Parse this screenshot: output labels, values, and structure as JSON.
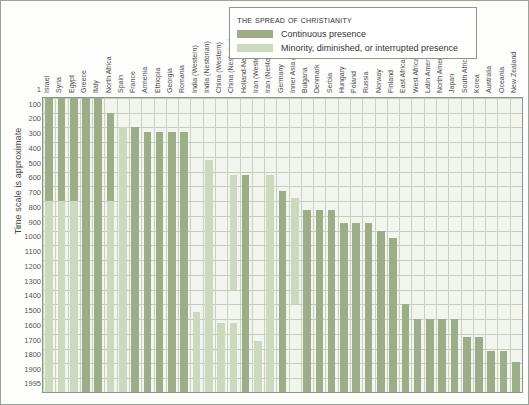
{
  "axis": {
    "y_title": "Time scale is approximate",
    "y_ticks": [
      "1",
      "100",
      "200",
      "300",
      "400",
      "500",
      "600",
      "700",
      "800",
      "900",
      "1000",
      "1100",
      "1200",
      "1300",
      "1400",
      "1500",
      "1600",
      "1700",
      "1800",
      "1900",
      "1995"
    ]
  },
  "legend": {
    "title": "The spread of Christianity",
    "entries": [
      {
        "key": "continuous",
        "label": "Continuous presence",
        "color": "#9cad88"
      },
      {
        "key": "minority",
        "label": "Minority, diminished, or interrupted presence",
        "color": "#cdd9bf"
      }
    ]
  },
  "chart_data": {
    "type": "bar",
    "title": "The spread of Christianity",
    "xlabel": "",
    "ylabel": "Time scale is approximate",
    "ylim": [
      1,
      1995
    ],
    "y_inverted": true,
    "grid": true,
    "legend_position": "top-right",
    "series": [
      {
        "name": "Continuous presence",
        "color": "#9cad88"
      },
      {
        "name": "Minority, diminished, or interrupted presence",
        "color": "#cdd9bf"
      }
    ],
    "categories": [
      "Israel",
      "Syria",
      "Egypt",
      "Greece",
      "Italy",
      "North Africa",
      "Spain",
      "France",
      "Armenia",
      "Ethiopia",
      "Georgia",
      "Romania",
      "India (Western)",
      "India (Nestorian)",
      "China (Western)",
      "China (Nestorian)",
      "Holland-Netherlands",
      "Iran (Western)",
      "Iran (Nestorian)",
      "Germany",
      "Inner Asia (Nestorian)",
      "Bulgaria",
      "Denmark",
      "Serbia",
      "Hungary",
      "Poland",
      "Russia",
      "Norway",
      "Finland",
      "East Africa",
      "West Africa",
      "Latin America",
      "North America",
      "Japan",
      "South Africa",
      "Korea",
      "Australia",
      "Oceania",
      "New Zealand"
    ],
    "bars": [
      {
        "category": "Israel",
        "spans": [
          {
            "type": "continuous",
            "from": 1,
            "to": 700
          },
          {
            "type": "minority",
            "from": 700,
            "to": 1995
          }
        ]
      },
      {
        "category": "Syria",
        "spans": [
          {
            "type": "continuous",
            "from": 1,
            "to": 700
          },
          {
            "type": "minority",
            "from": 700,
            "to": 1995
          }
        ]
      },
      {
        "category": "Egypt",
        "spans": [
          {
            "type": "continuous",
            "from": 1,
            "to": 700
          },
          {
            "type": "minority",
            "from": 700,
            "to": 1995
          }
        ]
      },
      {
        "category": "Greece",
        "spans": [
          {
            "type": "continuous",
            "from": 1,
            "to": 1995
          }
        ]
      },
      {
        "category": "Italy",
        "spans": [
          {
            "type": "continuous",
            "from": 1,
            "to": 1995
          }
        ]
      },
      {
        "category": "North Africa",
        "spans": [
          {
            "type": "continuous",
            "from": 100,
            "to": 700
          },
          {
            "type": "minority",
            "from": 700,
            "to": 1995
          }
        ]
      },
      {
        "category": "Spain",
        "spans": [
          {
            "type": "minority",
            "from": 200,
            "to": 1995
          }
        ]
      },
      {
        "category": "France",
        "spans": [
          {
            "type": "continuous",
            "from": 200,
            "to": 1995
          }
        ]
      },
      {
        "category": "Armenia",
        "spans": [
          {
            "type": "continuous",
            "from": 230,
            "to": 1995
          }
        ]
      },
      {
        "category": "Ethiopia",
        "spans": [
          {
            "type": "continuous",
            "from": 230,
            "to": 1995
          }
        ]
      },
      {
        "category": "Georgia",
        "spans": [
          {
            "type": "continuous",
            "from": 230,
            "to": 1995
          }
        ]
      },
      {
        "category": "Romania",
        "spans": [
          {
            "type": "continuous",
            "from": 230,
            "to": 1995
          }
        ]
      },
      {
        "category": "India (Western)",
        "spans": [
          {
            "type": "minority",
            "from": 1450,
            "to": 1995
          }
        ]
      },
      {
        "category": "India (Nestorian)",
        "spans": [
          {
            "type": "minority",
            "from": 420,
            "to": 1995
          }
        ]
      },
      {
        "category": "China (Western)",
        "spans": [
          {
            "type": "minority",
            "from": 1530,
            "to": 1995
          }
        ]
      },
      {
        "category": "China (Nestorian)",
        "spans": [
          {
            "type": "minority",
            "from": 520,
            "to": 1300
          },
          {
            "type": "minority",
            "from": 1530,
            "to": 1995
          }
        ]
      },
      {
        "category": "Holland-Netherlands",
        "spans": [
          {
            "type": "continuous",
            "from": 520,
            "to": 1995
          }
        ]
      },
      {
        "category": "Iran (Western)",
        "spans": [
          {
            "type": "minority",
            "from": 1650,
            "to": 1995
          }
        ]
      },
      {
        "category": "Iran (Nestorian)",
        "spans": [
          {
            "type": "minority",
            "from": 520,
            "to": 1995
          }
        ]
      },
      {
        "category": "Germany",
        "spans": [
          {
            "type": "continuous",
            "from": 630,
            "to": 1995
          }
        ]
      },
      {
        "category": "Inner Asia (Nestorian)",
        "spans": [
          {
            "type": "minority",
            "from": 680,
            "to": 1400
          }
        ]
      },
      {
        "category": "Bulgaria",
        "spans": [
          {
            "type": "continuous",
            "from": 760,
            "to": 1995
          }
        ]
      },
      {
        "category": "Denmark",
        "spans": [
          {
            "type": "continuous",
            "from": 760,
            "to": 1995
          }
        ]
      },
      {
        "category": "Serbia",
        "spans": [
          {
            "type": "continuous",
            "from": 760,
            "to": 1995
          }
        ]
      },
      {
        "category": "Hungary",
        "spans": [
          {
            "type": "continuous",
            "from": 850,
            "to": 1995
          }
        ]
      },
      {
        "category": "Poland",
        "spans": [
          {
            "type": "continuous",
            "from": 850,
            "to": 1995
          }
        ]
      },
      {
        "category": "Russia",
        "spans": [
          {
            "type": "continuous",
            "from": 850,
            "to": 1995
          }
        ]
      },
      {
        "category": "Norway",
        "spans": [
          {
            "type": "continuous",
            "from": 900,
            "to": 1995
          }
        ]
      },
      {
        "category": "Finland",
        "spans": [
          {
            "type": "continuous",
            "from": 950,
            "to": 1995
          }
        ]
      },
      {
        "category": "East Africa",
        "spans": [
          {
            "type": "continuous",
            "from": 1400,
            "to": 1995
          }
        ]
      },
      {
        "category": "West Africa",
        "spans": [
          {
            "type": "continuous",
            "from": 1500,
            "to": 1995
          }
        ]
      },
      {
        "category": "Latin America",
        "spans": [
          {
            "type": "continuous",
            "from": 1500,
            "to": 1995
          }
        ]
      },
      {
        "category": "North America",
        "spans": [
          {
            "type": "continuous",
            "from": 1500,
            "to": 1995
          }
        ]
      },
      {
        "category": "Japan",
        "spans": [
          {
            "type": "continuous",
            "from": 1500,
            "to": 1995
          }
        ]
      },
      {
        "category": "South Africa",
        "spans": [
          {
            "type": "continuous",
            "from": 1620,
            "to": 1995
          }
        ]
      },
      {
        "category": "Korea",
        "spans": [
          {
            "type": "continuous",
            "from": 1620,
            "to": 1995
          }
        ]
      },
      {
        "category": "Australia",
        "spans": [
          {
            "type": "continuous",
            "from": 1720,
            "to": 1995
          }
        ]
      },
      {
        "category": "Oceania",
        "spans": [
          {
            "type": "continuous",
            "from": 1720,
            "to": 1995
          }
        ]
      },
      {
        "category": "New Zealand",
        "spans": [
          {
            "type": "continuous",
            "from": 1790,
            "to": 1995
          }
        ]
      }
    ]
  }
}
